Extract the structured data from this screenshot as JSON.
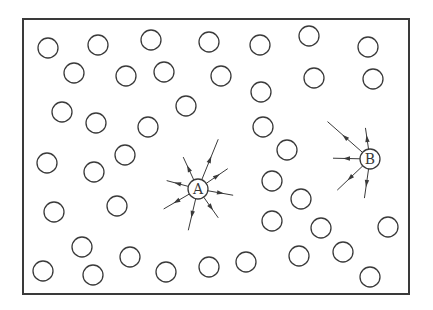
{
  "diagram": {
    "frame": {
      "x": 23,
      "y": 19,
      "w": 386,
      "h": 275
    },
    "stroke_color": "#3a3a3a",
    "circle_radius": 10,
    "labeled_nodes": [
      {
        "id": "A",
        "label": "A",
        "x": 198,
        "y": 189
      },
      {
        "id": "B",
        "label": "B",
        "x": 370,
        "y": 159
      }
    ],
    "circles": [
      [
        48,
        48
      ],
      [
        98,
        45
      ],
      [
        151,
        40
      ],
      [
        209,
        42
      ],
      [
        260,
        45
      ],
      [
        309,
        36
      ],
      [
        368,
        47
      ],
      [
        74,
        73
      ],
      [
        126,
        76
      ],
      [
        164,
        72
      ],
      [
        221,
        76
      ],
      [
        314,
        78
      ],
      [
        373,
        79
      ],
      [
        62,
        112
      ],
      [
        96,
        123
      ],
      [
        148,
        127
      ],
      [
        186,
        106
      ],
      [
        261,
        92
      ],
      [
        263,
        127
      ],
      [
        47,
        163
      ],
      [
        94,
        172
      ],
      [
        125,
        155
      ],
      [
        287,
        150
      ],
      [
        54,
        212
      ],
      [
        117,
        206
      ],
      [
        272,
        181
      ],
      [
        301,
        199
      ],
      [
        388,
        227
      ],
      [
        82,
        247
      ],
      [
        130,
        257
      ],
      [
        166,
        272
      ],
      [
        209,
        267
      ],
      [
        246,
        262
      ],
      [
        299,
        256
      ],
      [
        343,
        252
      ],
      [
        370,
        277
      ],
      [
        43,
        271
      ],
      [
        93,
        275
      ],
      [
        272,
        221
      ],
      [
        321,
        228
      ]
    ],
    "edges": [
      {
        "from": "A",
        "to": [
          157,
          178
        ]
      },
      {
        "from": "A",
        "to": [
          155,
          214
        ]
      },
      {
        "from": "A",
        "to": [
          186,
          240
        ]
      },
      {
        "from": "A",
        "to": [
          224,
          226
        ]
      },
      {
        "from": "A",
        "to": [
          243,
          197
        ]
      },
      {
        "from": "A",
        "to": [
          236,
          163
        ]
      },
      {
        "from": "A",
        "to": [
          222,
          130
        ]
      },
      {
        "from": "A",
        "to": [
          179,
          148
        ]
      },
      {
        "from": "B",
        "to": [
          323,
          158
        ]
      },
      {
        "from": "B",
        "to": [
          330,
          197
        ]
      },
      {
        "from": "B",
        "to": [
          363,
          208
        ]
      },
      {
        "from": "B",
        "to": [
          320,
          115
        ]
      },
      {
        "from": "B",
        "to": [
          364,
          118
        ]
      }
    ]
  }
}
